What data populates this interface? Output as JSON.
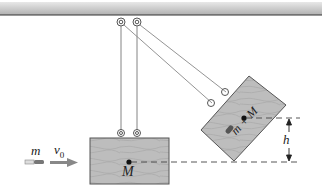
{
  "diagram": {
    "labels": {
      "bullet_mass": "m",
      "bullet_velocity": "v",
      "velocity_subscript": "0",
      "block_mass": "M",
      "combined_mass": "m + M",
      "height": "h"
    },
    "colors": {
      "ceiling": "#b8b8b8",
      "block_fill": "#b9b9b9",
      "block_edge": "#555555",
      "string": "#777777",
      "arrow": "#888888",
      "dash": "#444444"
    }
  }
}
